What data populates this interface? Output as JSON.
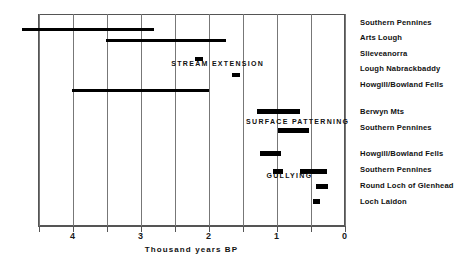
{
  "chart_data": {
    "type": "bar",
    "orientation": "horizontal",
    "title": "",
    "xlabel": "Thousand years BP",
    "ylabel": "",
    "xlim": [
      4.5,
      0.0
    ],
    "x_axis_reversed": true,
    "grid": true,
    "gridlines": [
      4.5,
      4.0,
      3.5,
      3.0,
      2.5,
      2.0,
      1.5,
      1.0,
      0.5,
      0.0
    ],
    "xticks": [
      4.5,
      4.0,
      3.5,
      3.0,
      2.5,
      2.0,
      1.5,
      1.0,
      0.5,
      0.0
    ],
    "xticklabels": [
      "",
      "4",
      "",
      "3",
      "",
      "2",
      "",
      "1",
      "",
      "0"
    ],
    "group_annotations": [
      {
        "text": "STREAM  EXTENSION",
        "x": 2.55,
        "y_index": 2.6
      },
      {
        "text": "SURFACE  PATTERNING",
        "x": 1.45,
        "y_index": 6.2
      },
      {
        "text": "GULLYING",
        "x": 1.15,
        "y_index": 9.6
      }
    ],
    "series": [
      {
        "name": "Southern Pennines",
        "group": "STREAM EXTENSION",
        "start": 4.74,
        "end": 2.8
      },
      {
        "name": "Arts Lough",
        "group": "STREAM EXTENSION",
        "start": 3.51,
        "end": 1.74
      },
      {
        "name": "Slieveanorra",
        "group": "STREAM EXTENSION",
        "start": 2.2,
        "end": 2.08
      },
      {
        "name": "Lough Nabrackbaddy",
        "group": "STREAM EXTENSION",
        "start": 1.66,
        "end": 1.54
      },
      {
        "name": "Howgill/Bowland Fells",
        "group": "STREAM EXTENSION",
        "start": 4.01,
        "end": 1.99
      },
      {
        "name": "Berwyn Mts",
        "group": "SURFACE PATTERNING",
        "start": 1.29,
        "end": 0.65
      },
      {
        "name": "Southern Pennines",
        "group": "SURFACE PATTERNING",
        "start": 0.98,
        "end": 0.53
      },
      {
        "name": "Howgill/Bowland Fells",
        "group": "GULLYING",
        "start": 1.25,
        "end": 0.93
      },
      {
        "name": "Southern Pennines",
        "group": "GULLYING",
        "start": 1.05,
        "end": 0.91
      },
      {
        "name": "Southern Pennines",
        "group": "GULLYING",
        "start": 0.66,
        "end": 0.26
      },
      {
        "name": "Round Loch of Glenhead",
        "group": "GULLYING",
        "start": 0.42,
        "end": 0.24
      },
      {
        "name": "Loch Laidon",
        "group": "GULLYING",
        "start": 0.47,
        "end": 0.36
      }
    ],
    "site_labels": [
      "Southern Pennines",
      "Arts Lough",
      "Slieveanorra",
      "Lough Nabrackbaddy",
      "Howgill/Bowland Fells",
      "Berwyn Mts",
      "Southern Pennines",
      "Howgill/Bowland Fells",
      "Southern Pennines",
      "Round Loch of Glenhead",
      "Loch Laidon"
    ],
    "colors": {
      "bar": "#000000",
      "grid": "#777777",
      "axis": "#555555",
      "text": "#111111",
      "background": "#ffffff"
    }
  },
  "geometry": {
    "bar_rows_px": [
      {
        "top": 27.5,
        "height": 3.0
      },
      {
        "top": 38.5,
        "height": 3.4
      },
      {
        "top": 57.0,
        "height": 4.2
      },
      {
        "top": 73.0,
        "height": 4.4
      },
      {
        "top": 88.5,
        "height": 3.4
      },
      {
        "top": 109.0,
        "height": 5.0
      },
      {
        "top": 127.5,
        "height": 5.0
      },
      {
        "top": 150.5,
        "height": 5.0
      },
      {
        "top": 168.5,
        "height": 5.0
      },
      {
        "top": 168.5,
        "height": 5.4
      },
      {
        "top": 184.0,
        "height": 5.0
      },
      {
        "top": 198.5,
        "height": 5.0
      }
    ],
    "site_label_tops_px": [
      18,
      33,
      49,
      64,
      80,
      107,
      123,
      149,
      165,
      181,
      197
    ]
  }
}
